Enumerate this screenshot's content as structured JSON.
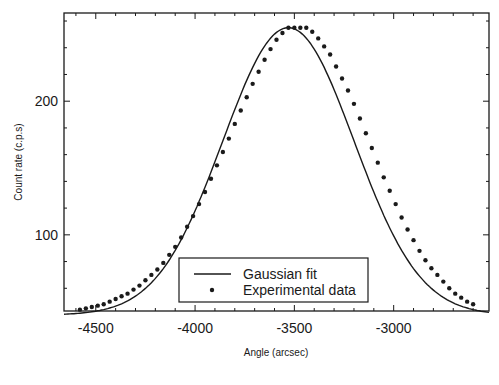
{
  "chart_data": {
    "type": "scatter",
    "title": "",
    "xlabel": "Angle (arcsec)",
    "ylabel": "Count rate (c.p.s)",
    "xlim": [
      -4660,
      -2520
    ],
    "ylim": [
      43,
      266
    ],
    "xticks": [
      -4500,
      -4000,
      -3500,
      -3000
    ],
    "xtick_labels": [
      "-4500",
      "-4000",
      "-3500",
      "-3000"
    ],
    "yticks": [
      100,
      200
    ],
    "ytick_labels": [
      "100",
      "200"
    ],
    "grid": false,
    "legend_position": "lower center",
    "legend": [
      "Gaussian fit",
      "Experimental data"
    ],
    "series": [
      {
        "name": "Gaussian fit",
        "kind": "line",
        "model": {
          "amplitude": 215,
          "center": -3530,
          "sigma": 330,
          "baseline": 40
        }
      },
      {
        "name": "Experimental data",
        "kind": "points",
        "x": [
          -4580,
          -4550,
          -4520,
          -4490,
          -4460,
          -4430,
          -4400,
          -4370,
          -4340,
          -4310,
          -4280,
          -4250,
          -4220,
          -4190,
          -4160,
          -4130,
          -4100,
          -4070,
          -4040,
          -4010,
          -3980,
          -3950,
          -3920,
          -3890,
          -3860,
          -3830,
          -3800,
          -3770,
          -3740,
          -3710,
          -3680,
          -3650,
          -3620,
          -3590,
          -3560,
          -3530,
          -3500,
          -3470,
          -3440,
          -3410,
          -3380,
          -3350,
          -3320,
          -3290,
          -3260,
          -3230,
          -3200,
          -3170,
          -3140,
          -3110,
          -3080,
          -3050,
          -3020,
          -2990,
          -2960,
          -2930,
          -2900,
          -2870,
          -2840,
          -2810,
          -2780,
          -2750,
          -2720,
          -2690,
          -2660,
          -2630,
          -2600
        ],
        "y": [
          44,
          45,
          46,
          47,
          48,
          50,
          52,
          54,
          56,
          59,
          62,
          66,
          70,
          74,
          79,
          85,
          91,
          98,
          106,
          114,
          123,
          132,
          142,
          152,
          162,
          172,
          183,
          193,
          203,
          213,
          222,
          231,
          239,
          246,
          251,
          255,
          255,
          255,
          255,
          252,
          247,
          241,
          235,
          226,
          217,
          208,
          198,
          187,
          176,
          165,
          154,
          143,
          133,
          123,
          113,
          104,
          96,
          88,
          81,
          75,
          70,
          65,
          60,
          56,
          53,
          50,
          48
        ]
      }
    ]
  },
  "legend": {
    "line_label": "Gaussian fit",
    "points_label": "Experimental data"
  },
  "axes": {
    "x_title": "Angle (arcsec)",
    "y_title": "Count rate (c.p.s)"
  },
  "colors": {
    "ink": "#1a1a1a",
    "background": "#ffffff"
  }
}
